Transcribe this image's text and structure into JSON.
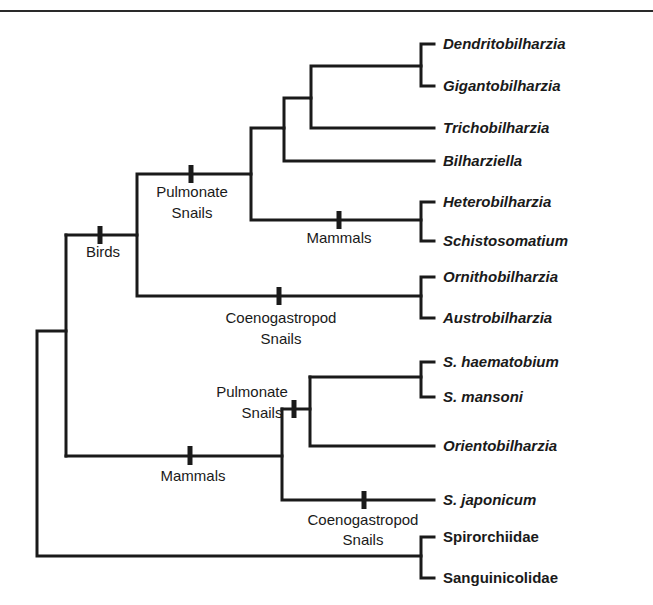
{
  "figure": {
    "type": "phylogenetic-tree",
    "taxa": [
      {
        "label": "Dendritobilharzia",
        "italic": true
      },
      {
        "label": "Gigantobilharzia",
        "italic": true
      },
      {
        "label": "Trichobilharzia",
        "italic": true
      },
      {
        "label": "Bilharziella",
        "italic": true
      },
      {
        "label": "Heterobilharzia",
        "italic": true
      },
      {
        "label": "Schistosomatium",
        "italic": true
      },
      {
        "label": "Ornithobilharzia",
        "italic": true
      },
      {
        "label": "Austrobilharzia",
        "italic": true
      },
      {
        "label": "S. haematobium",
        "italic": true
      },
      {
        "label": "S. mansoni",
        "italic": true
      },
      {
        "label": "Orientobilharzia",
        "italic": true
      },
      {
        "label": "S. japonicum",
        "italic": true
      },
      {
        "label": "Spirorchiidae",
        "italic": false
      },
      {
        "label": "Sanguinicolidae",
        "italic": false
      }
    ],
    "host_events": {
      "birds": {
        "line1": "Birds"
      },
      "pulmonate_upper": {
        "line1": "Pulmonate",
        "line2": "Snails"
      },
      "mammals_upper": {
        "line1": "Mammals"
      },
      "coeno_upper": {
        "line1": "Coenogastropod",
        "line2": "Snails"
      },
      "pulmonate_lower": {
        "line1": "Pulmonate",
        "line2": "Snails"
      },
      "mammals_lower": {
        "line1": "Mammals"
      },
      "coeno_lower": {
        "line1": "Coenogastropod",
        "line2": "Snails"
      }
    }
  }
}
